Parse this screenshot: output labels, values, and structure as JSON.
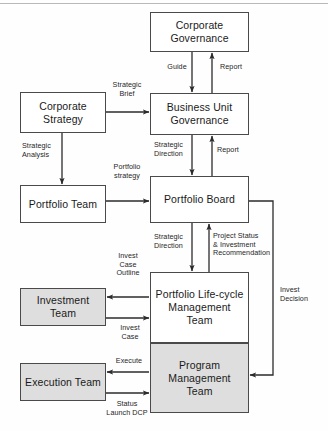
{
  "diagram": {
    "type": "flowchart",
    "colors": {
      "box_stroke": "#4a4a4a",
      "box_fill_white": "#ffffff",
      "box_fill_gray": "#dedede",
      "arrow": "#2b2b2b",
      "text": "#1a1a1a",
      "background": "#fefefe"
    },
    "nodes": [
      {
        "id": "corporate_governance",
        "label": "Corporate\nGovernance",
        "fill": "white",
        "x": 150,
        "y": 12,
        "w": 99,
        "h": 40
      },
      {
        "id": "corporate_strategy",
        "label": "Corporate\nStrategy",
        "fill": "white",
        "x": 20,
        "y": 92,
        "w": 86,
        "h": 41
      },
      {
        "id": "business_unit_governance",
        "label": "Business Unit\nGovernance",
        "fill": "white",
        "x": 150,
        "y": 93,
        "w": 99,
        "h": 42
      },
      {
        "id": "portfolio_team",
        "label": "Portfolio Team",
        "fill": "white",
        "x": 20,
        "y": 185,
        "w": 86,
        "h": 38
      },
      {
        "id": "portfolio_board",
        "label": "Portfolio Board",
        "fill": "white",
        "x": 150,
        "y": 176,
        "w": 99,
        "h": 47
      },
      {
        "id": "investment_team",
        "label": "Investment Team",
        "fill": "gray",
        "x": 20,
        "y": 288,
        "w": 86,
        "h": 38
      },
      {
        "id": "portfolio_lifecycle_management_team",
        "label": "Portfolio Life-cycle\nManagement\nTeam",
        "fill": "white",
        "x": 150,
        "y": 272,
        "w": 99,
        "h": 71
      },
      {
        "id": "execution_team",
        "label": "Execution Team",
        "fill": "gray",
        "x": 20,
        "y": 363,
        "w": 86,
        "h": 38
      },
      {
        "id": "program_management_team",
        "label": "Program\nManagement Team",
        "fill": "gray",
        "x": 150,
        "y": 343,
        "w": 99,
        "h": 70
      }
    ],
    "edges": [
      {
        "id": "guide",
        "label": "Guide",
        "from": "corporate_governance",
        "to": "business_unit_governance",
        "label_x": 163,
        "label_y": 63
      },
      {
        "id": "report_cg",
        "label": "Report",
        "from": "business_unit_governance",
        "to": "corporate_governance",
        "label_x": 216,
        "label_y": 63
      },
      {
        "id": "strategic_brief",
        "label": "Strategic\nBrief",
        "from": "corporate_strategy",
        "to": "business_unit_governance",
        "label_x": 111,
        "label_y": 81
      },
      {
        "id": "strategic_analysis",
        "label": "Strategic\nAnalysis",
        "from": "corporate_strategy",
        "to": "portfolio_team",
        "label_x": 22,
        "label_y": 142
      },
      {
        "id": "strategic_direction_bug",
        "label": "Strategic\nDirection",
        "from": "business_unit_governance",
        "to": "portfolio_board",
        "label_x": 154,
        "label_y": 142
      },
      {
        "id": "report_bug",
        "label": "Report",
        "from": "portfolio_board",
        "to": "business_unit_governance",
        "label_x": 218,
        "label_y": 147
      },
      {
        "id": "portfolio_strategy",
        "label": "Portfolio\nstrategy",
        "from": "portfolio_team",
        "to": "portfolio_board",
        "label_x": 110,
        "label_y": 163
      },
      {
        "id": "strategic_direction_pb",
        "label": "Strategic\nDirection",
        "from": "portfolio_board",
        "to": "portfolio_lifecycle_management_team",
        "label_x": 154,
        "label_y": 234
      },
      {
        "id": "project_status",
        "label": "Project Status\n& Investment\nRecommendation",
        "from": "portfolio_lifecycle_management_team",
        "to": "portfolio_board",
        "label_x": 214,
        "label_y": 232
      },
      {
        "id": "invest_case_outline",
        "label": "Invest\nCase\nOutline",
        "from": "portfolio_lifecycle_management_team",
        "to": "investment_team",
        "label_x": 113,
        "label_y": 252
      },
      {
        "id": "invest_case",
        "label": "Invest\nCase",
        "from": "investment_team",
        "to": "portfolio_lifecycle_management_team",
        "label_x": 115,
        "label_y": 325
      },
      {
        "id": "invest_decision",
        "label": "Invest\nDecision",
        "from": "portfolio_board",
        "to": "program_management_team",
        "label_x": 280,
        "label_y": 287
      },
      {
        "id": "execute",
        "label": "Execute",
        "from": "program_management_team",
        "to": "execution_team",
        "label_x": 114,
        "label_y": 358
      },
      {
        "id": "status_launch_dcp",
        "label": "Status\nLaunch DCP",
        "from": "execution_team",
        "to": "program_management_team",
        "label_x": 107,
        "label_y": 401
      }
    ]
  }
}
